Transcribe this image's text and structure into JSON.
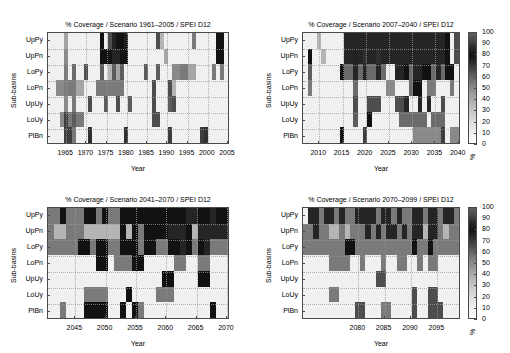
{
  "figure": {
    "width": 510,
    "height": 353,
    "background": "#ffffff",
    "axis_color": "#4a4a4a",
    "grid_color": "#9a9a9a"
  },
  "common": {
    "xlabel": "Year",
    "ylabel": "Sub-basins",
    "subbasins": [
      "UpPy",
      "UpPn",
      "LoPy",
      "LoPn",
      "UpUy",
      "LoUy",
      "PlBn"
    ],
    "colorbar": {
      "unit": "%",
      "ticks": [
        "100",
        "90",
        "80",
        "70",
        "60",
        "50",
        "40",
        "30",
        "20",
        "10",
        "0"
      ],
      "vmin": 0,
      "vmax": 100
    }
  },
  "chart_data": [
    {
      "id": "panel-top-left",
      "type": "heatmap",
      "title": "% Coverage / Scenario 1961–2005 / SPEI D12",
      "xlabel": "Year",
      "ylabel": "Sub-basins",
      "xlim": [
        1961,
        2005
      ],
      "xticks": [
        "1965",
        "1970",
        "1975",
        "1980",
        "1985",
        "1990",
        "1995",
        "2000",
        "2005"
      ],
      "xtick_values": [
        1965,
        1970,
        1975,
        1980,
        1985,
        1990,
        1995,
        2000,
        2005
      ],
      "yticks": [
        "UpPy",
        "UpPn",
        "LoPy",
        "LoPn",
        "UpUy",
        "LoUy",
        "PlBn"
      ],
      "zlim": [
        0,
        100
      ],
      "zlabel": "%",
      "has_colorbar": false,
      "x": [
        1961,
        1962,
        1963,
        1964,
        1965,
        1966,
        1967,
        1968,
        1969,
        1970,
        1971,
        1972,
        1973,
        1974,
        1975,
        1976,
        1977,
        1978,
        1979,
        1980,
        1981,
        1982,
        1983,
        1984,
        1985,
        1986,
        1987,
        1988,
        1989,
        1990,
        1991,
        1992,
        1993,
        1994,
        1995,
        1996,
        1997,
        1998,
        1999,
        2000,
        2001,
        2002,
        2003,
        2004,
        2005
      ],
      "values": [
        [
          5,
          5,
          5,
          5,
          30,
          5,
          5,
          5,
          5,
          5,
          5,
          5,
          5,
          80,
          5,
          60,
          75,
          80,
          80,
          75,
          5,
          5,
          5,
          5,
          5,
          5,
          5,
          60,
          25,
          5,
          5,
          5,
          5,
          5,
          5,
          5,
          45,
          5,
          5,
          5,
          5,
          5,
          80,
          80,
          5
        ],
        [
          5,
          5,
          5,
          5,
          40,
          5,
          5,
          5,
          5,
          5,
          5,
          5,
          5,
          80,
          80,
          80,
          85,
          85,
          80,
          80,
          5,
          5,
          5,
          5,
          5,
          5,
          5,
          5,
          5,
          30,
          5,
          5,
          5,
          5,
          5,
          5,
          5,
          5,
          5,
          5,
          5,
          5,
          80,
          80,
          5
        ],
        [
          5,
          5,
          5,
          5,
          45,
          5,
          50,
          5,
          5,
          60,
          5,
          5,
          5,
          55,
          5,
          25,
          55,
          30,
          55,
          5,
          5,
          5,
          5,
          5,
          55,
          5,
          5,
          55,
          5,
          5,
          5,
          40,
          40,
          45,
          45,
          30,
          30,
          5,
          5,
          5,
          5,
          45,
          5,
          45,
          5
        ],
        [
          5,
          5,
          40,
          40,
          45,
          45,
          45,
          30,
          30,
          5,
          5,
          5,
          45,
          45,
          45,
          45,
          45,
          45,
          45,
          5,
          5,
          5,
          5,
          5,
          5,
          5,
          60,
          5,
          5,
          5,
          60,
          25,
          5,
          5,
          5,
          5,
          5,
          5,
          5,
          5,
          5,
          5,
          5,
          5,
          5
        ],
        [
          5,
          5,
          5,
          5,
          40,
          5,
          45,
          5,
          5,
          5,
          60,
          5,
          5,
          5,
          55,
          5,
          5,
          60,
          5,
          5,
          55,
          5,
          5,
          5,
          5,
          5,
          60,
          5,
          5,
          5,
          55,
          60,
          5,
          5,
          5,
          5,
          5,
          5,
          5,
          5,
          5,
          5,
          5,
          5,
          5
        ],
        [
          5,
          5,
          5,
          40,
          65,
          45,
          55,
          45,
          45,
          5,
          5,
          5,
          5,
          5,
          5,
          5,
          5,
          5,
          5,
          5,
          5,
          5,
          5,
          5,
          5,
          5,
          60,
          60,
          5,
          5,
          5,
          5,
          5,
          5,
          5,
          5,
          5,
          5,
          5,
          5,
          5,
          5,
          5,
          5,
          5
        ],
        [
          5,
          5,
          5,
          5,
          65,
          65,
          45,
          5,
          5,
          5,
          70,
          5,
          5,
          5,
          5,
          5,
          5,
          5,
          5,
          70,
          5,
          5,
          5,
          5,
          5,
          5,
          5,
          5,
          5,
          5,
          65,
          5,
          5,
          5,
          5,
          5,
          5,
          5,
          65,
          70,
          5,
          5,
          5,
          5,
          5
        ]
      ]
    },
    {
      "id": "panel-top-right",
      "type": "heatmap",
      "title": "% Coverage / Scenario 2007–2040 / SPEI D12",
      "xlabel": "Year",
      "ylabel": "Sub-basins",
      "xlim": [
        2007,
        2040
      ],
      "xticks": [
        "2010",
        "2015",
        "2020",
        "2025",
        "2030",
        "2035",
        "2040"
      ],
      "xtick_values": [
        2010,
        2015,
        2020,
        2025,
        2030,
        2035,
        2040
      ],
      "yticks": [
        "UpPy",
        "UpPn",
        "LoPy",
        "LoPn",
        "UpUy",
        "LoUy",
        "PlBn"
      ],
      "zlim": [
        0,
        100
      ],
      "zlabel": "%",
      "has_colorbar": true,
      "x": [
        2007,
        2008,
        2009,
        2010,
        2011,
        2012,
        2013,
        2014,
        2015,
        2016,
        2017,
        2018,
        2019,
        2020,
        2021,
        2022,
        2023,
        2024,
        2025,
        2026,
        2027,
        2028,
        2029,
        2030,
        2031,
        2032,
        2033,
        2034,
        2035,
        2036,
        2037,
        2038,
        2039,
        2040
      ],
      "values": [
        [
          5,
          5,
          5,
          25,
          5,
          5,
          5,
          5,
          5,
          85,
          85,
          85,
          85,
          85,
          85,
          85,
          85,
          85,
          85,
          85,
          85,
          85,
          85,
          85,
          85,
          85,
          85,
          85,
          85,
          85,
          85,
          80,
          5,
          60
        ],
        [
          5,
          80,
          5,
          5,
          25,
          5,
          5,
          5,
          5,
          85,
          85,
          75,
          85,
          70,
          85,
          85,
          70,
          85,
          85,
          85,
          85,
          85,
          85,
          85,
          85,
          85,
          85,
          85,
          85,
          85,
          85,
          80,
          5,
          60
        ],
        [
          5,
          55,
          5,
          5,
          5,
          5,
          5,
          5,
          80,
          50,
          50,
          85,
          50,
          85,
          50,
          50,
          85,
          50,
          5,
          5,
          85,
          85,
          80,
          50,
          85,
          85,
          80,
          80,
          50,
          85,
          50,
          80,
          80,
          5
        ],
        [
          5,
          45,
          5,
          5,
          5,
          5,
          5,
          5,
          5,
          5,
          5,
          50,
          5,
          5,
          5,
          5,
          5,
          5,
          40,
          40,
          5,
          5,
          5,
          50,
          80,
          80,
          5,
          45,
          45,
          5,
          5,
          5,
          45,
          5
        ],
        [
          5,
          5,
          5,
          5,
          5,
          5,
          5,
          5,
          5,
          5,
          5,
          60,
          5,
          5,
          60,
          60,
          60,
          5,
          5,
          5,
          60,
          60,
          85,
          5,
          5,
          85,
          5,
          85,
          5,
          5,
          60,
          5,
          5,
          5
        ],
        [
          5,
          5,
          5,
          5,
          5,
          5,
          5,
          5,
          5,
          5,
          5,
          55,
          5,
          5,
          80,
          5,
          5,
          5,
          5,
          5,
          5,
          50,
          50,
          50,
          50,
          50,
          50,
          5,
          50,
          50,
          50,
          5,
          5,
          5
        ],
        [
          5,
          5,
          5,
          5,
          5,
          5,
          5,
          5,
          80,
          5,
          5,
          5,
          5,
          65,
          5,
          5,
          5,
          5,
          5,
          5,
          5,
          5,
          5,
          5,
          40,
          40,
          40,
          40,
          40,
          40,
          65,
          5,
          40,
          40
        ]
      ]
    },
    {
      "id": "panel-bottom-left",
      "type": "heatmap",
      "title": "% Coverage / Scenario 2041–2070 / SPEI D12",
      "xlabel": "Year",
      "ylabel": "Sub-basins",
      "xlim": [
        2041,
        2070
      ],
      "xticks": [
        "2045",
        "2050",
        "2055",
        "2060",
        "2065",
        "2070"
      ],
      "xtick_values": [
        2045,
        2050,
        2055,
        2060,
        2065,
        2070
      ],
      "yticks": [
        "UpPy",
        "UpPn",
        "LoPy",
        "LoPn",
        "UpUy",
        "LoUy",
        "PlBn"
      ],
      "zlim": [
        0,
        100
      ],
      "zlabel": "%",
      "has_colorbar": false,
      "x": [
        2041,
        2042,
        2043,
        2044,
        2045,
        2046,
        2047,
        2048,
        2049,
        2050,
        2051,
        2052,
        2053,
        2054,
        2055,
        2056,
        2057,
        2058,
        2059,
        2060,
        2061,
        2062,
        2063,
        2064,
        2065,
        2066,
        2067,
        2068,
        2069,
        2070
      ],
      "values": [
        [
          45,
          45,
          80,
          45,
          45,
          45,
          80,
          80,
          45,
          80,
          45,
          45,
          80,
          80,
          80,
          80,
          80,
          80,
          80,
          80,
          80,
          80,
          80,
          85,
          85,
          80,
          80,
          85,
          80,
          80
        ],
        [
          45,
          25,
          25,
          45,
          45,
          45,
          25,
          25,
          25,
          25,
          25,
          25,
          80,
          25,
          80,
          45,
          80,
          80,
          80,
          80,
          85,
          85,
          85,
          80,
          25,
          85,
          85,
          85,
          85,
          85
        ],
        [
          45,
          45,
          45,
          45,
          45,
          80,
          80,
          45,
          80,
          80,
          45,
          45,
          80,
          80,
          80,
          45,
          80,
          80,
          45,
          45,
          80,
          80,
          85,
          80,
          45,
          80,
          85,
          45,
          45,
          45
        ],
        [
          5,
          5,
          5,
          5,
          5,
          5,
          5,
          5,
          80,
          80,
          5,
          45,
          45,
          45,
          80,
          80,
          5,
          5,
          5,
          5,
          5,
          45,
          45,
          5,
          5,
          45,
          45,
          5,
          5,
          5
        ],
        [
          5,
          5,
          5,
          5,
          5,
          5,
          5,
          5,
          5,
          5,
          5,
          5,
          5,
          5,
          5,
          5,
          5,
          5,
          5,
          80,
          80,
          5,
          5,
          5,
          5,
          80,
          80,
          5,
          5,
          5
        ],
        [
          5,
          5,
          5,
          5,
          5,
          5,
          45,
          45,
          45,
          45,
          5,
          5,
          5,
          80,
          5,
          5,
          5,
          5,
          45,
          45,
          45,
          5,
          5,
          5,
          5,
          5,
          5,
          5,
          5,
          5
        ],
        [
          5,
          5,
          45,
          5,
          5,
          5,
          80,
          80,
          80,
          80,
          5,
          5,
          80,
          5,
          80,
          45,
          5,
          5,
          5,
          5,
          5,
          5,
          5,
          5,
          5,
          5,
          5,
          80,
          5,
          5
        ]
      ]
    },
    {
      "id": "panel-bottom-right",
      "type": "heatmap",
      "title": "% Coverage / Scenario 2070–2099 / SPEI D12",
      "xlabel": "Year",
      "ylabel": "Sub-basins",
      "xlim": [
        2070,
        2099
      ],
      "xticks": [
        "2080",
        "2085",
        "2090",
        "2095"
      ],
      "xtick_values": [
        2080,
        2085,
        2090,
        2095
      ],
      "yticks": [
        "UpPy",
        "UpPn",
        "LoPy",
        "LoPn",
        "UpUy",
        "LoUy",
        "PlBn"
      ],
      "zlim": [
        0,
        100
      ],
      "zlabel": "%",
      "has_colorbar": true,
      "x": [
        2070,
        2071,
        2072,
        2073,
        2074,
        2075,
        2076,
        2077,
        2078,
        2079,
        2080,
        2081,
        2082,
        2083,
        2084,
        2085,
        2086,
        2087,
        2088,
        2089,
        2090,
        2091,
        2092,
        2093,
        2094,
        2095,
        2096,
        2097,
        2098,
        2099
      ],
      "values": [
        [
          5,
          85,
          85,
          45,
          85,
          85,
          45,
          85,
          45,
          45,
          85,
          85,
          85,
          85,
          45,
          85,
          85,
          45,
          85,
          45,
          45,
          85,
          85,
          45,
          85,
          85,
          45,
          85,
          85,
          45
        ],
        [
          45,
          45,
          85,
          45,
          45,
          25,
          25,
          45,
          25,
          45,
          45,
          45,
          85,
          45,
          85,
          45,
          85,
          85,
          45,
          85,
          45,
          85,
          85,
          25,
          85,
          85,
          45,
          25,
          45,
          45
        ],
        [
          45,
          45,
          45,
          45,
          45,
          45,
          45,
          45,
          80,
          80,
          45,
          45,
          45,
          45,
          45,
          45,
          45,
          45,
          45,
          45,
          45,
          80,
          45,
          45,
          80,
          45,
          45,
          45,
          45,
          45
        ],
        [
          5,
          5,
          5,
          5,
          5,
          45,
          45,
          45,
          45,
          5,
          5,
          45,
          5,
          5,
          5,
          45,
          5,
          5,
          45,
          45,
          5,
          5,
          45,
          5,
          45,
          45,
          5,
          5,
          5,
          5
        ],
        [
          5,
          5,
          5,
          5,
          5,
          5,
          5,
          5,
          5,
          5,
          5,
          5,
          5,
          5,
          60,
          60,
          5,
          5,
          5,
          5,
          5,
          5,
          5,
          5,
          5,
          5,
          5,
          5,
          5,
          5
        ],
        [
          5,
          5,
          5,
          5,
          5,
          45,
          45,
          5,
          5,
          5,
          5,
          5,
          5,
          5,
          5,
          5,
          5,
          5,
          5,
          5,
          5,
          60,
          5,
          5,
          60,
          60,
          5,
          5,
          5,
          5
        ],
        [
          5,
          5,
          5,
          5,
          5,
          5,
          5,
          5,
          5,
          5,
          60,
          60,
          5,
          5,
          5,
          45,
          45,
          5,
          5,
          5,
          5,
          60,
          5,
          5,
          60,
          60,
          60,
          5,
          5,
          5
        ]
      ]
    }
  ]
}
